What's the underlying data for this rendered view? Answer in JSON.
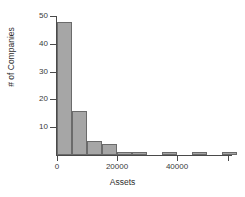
{
  "chart_data": {
    "type": "bar",
    "title": "",
    "subtitle": "",
    "xlabel": "Assets",
    "ylabel": "# of Companies",
    "xlim": [
      -2000,
      58000
    ],
    "ylim": [
      0,
      50
    ],
    "grid": false,
    "legend": null,
    "bin_width": 5000,
    "x_ticks": [
      {
        "value": 0,
        "label": "0"
      },
      {
        "value": 20000,
        "label": "20000"
      },
      {
        "value": 40000,
        "label": "40000"
      },
      {
        "value": 57000,
        "label": ""
      }
    ],
    "y_ticks": [
      {
        "value": 10,
        "label": "10"
      },
      {
        "value": 20,
        "label": "20"
      },
      {
        "value": 30,
        "label": "30"
      },
      {
        "value": 40,
        "label": "40"
      },
      {
        "value": 50,
        "label": "50"
      }
    ],
    "categories": [
      "0-5000",
      "5000-10000",
      "10000-15000",
      "15000-20000",
      "20000-25000",
      "25000-30000",
      "30000-35000",
      "35000-40000",
      "40000-45000",
      "45000-50000",
      "50000-55000",
      "55000-60000"
    ],
    "bins": [
      {
        "start": 0,
        "end": 5000,
        "count": 48
      },
      {
        "start": 5000,
        "end": 10000,
        "count": 16
      },
      {
        "start": 10000,
        "end": 15000,
        "count": 5
      },
      {
        "start": 15000,
        "end": 20000,
        "count": 4
      },
      {
        "start": 20000,
        "end": 25000,
        "count": 1
      },
      {
        "start": 25000,
        "end": 30000,
        "count": 1
      },
      {
        "start": 30000,
        "end": 35000,
        "count": 0
      },
      {
        "start": 35000,
        "end": 40000,
        "count": 1
      },
      {
        "start": 40000,
        "end": 45000,
        "count": 0
      },
      {
        "start": 45000,
        "end": 50000,
        "count": 1
      },
      {
        "start": 50000,
        "end": 55000,
        "count": 0
      },
      {
        "start": 55000,
        "end": 60000,
        "count": 1
      }
    ],
    "values": [
      48,
      16,
      5,
      4,
      1,
      1,
      0,
      1,
      0,
      1,
      0,
      1
    ],
    "colors": {
      "bar_fill": "#a6a6a6",
      "bar_edge": "#6b6b6b",
      "axis": "#4a4a4a",
      "text": "#2e2e2e",
      "background": "#ffffff"
    }
  }
}
